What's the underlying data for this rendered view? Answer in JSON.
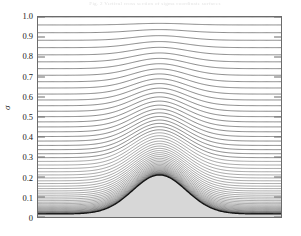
{
  "figure": {
    "caption_top": "Fig. 2   Vertical cross section of sigma coordinate surfaces",
    "background_color": "#ffffff"
  },
  "chart_data": {
    "type": "line",
    "title": "",
    "subtitle": "",
    "xlabel": "",
    "ylabel": "σ",
    "xlim": [
      0,
      1
    ],
    "ylim": [
      0,
      1
    ],
    "grid": false,
    "legend": null,
    "axis": {
      "y_ticks": [
        0,
        0.1,
        0.2,
        0.3,
        0.4,
        0.5,
        0.6,
        0.7,
        0.8,
        0.9,
        1.0
      ],
      "y_tick_labels": [
        "0",
        "0.1",
        "0.2",
        "0.3",
        "0.4",
        "0.5",
        "0.6",
        "0.7",
        "0.8",
        "0.9",
        "1.0"
      ],
      "y_tick_side": "left",
      "x_ticks": [],
      "x_tick_labels": [],
      "frame_color": "#6b6b6b"
    },
    "terrain": {
      "name": "bell-shaped mountain",
      "fill_color": "#d7d7d7",
      "outline_color": "#111111",
      "peak_sigma": 0.21,
      "base_sigma": 0.015,
      "peak_x": 0.5,
      "half_width": 0.22,
      "description": "Gaussian / bell shaped topography centered in the domain"
    },
    "contours": {
      "name": "terrain-following sigma coordinate surfaces",
      "count": 60,
      "color": "#3a3a3a",
      "top_sigma": 1.0,
      "description": "Coordinate surfaces flatten toward the model top and conform to the terrain near the ground; spacing compresses strongly just above the surface producing a dense dark band."
    }
  }
}
